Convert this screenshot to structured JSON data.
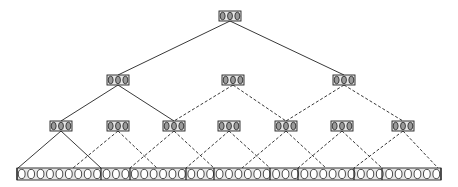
{
  "diagram": {
    "type": "tree",
    "colors": {
      "background": "#ffffff",
      "stroke": "#222222",
      "node_fill": "#e6e6e6",
      "ellipse_fill": "#9a9a9a"
    },
    "levels": [
      {
        "level": 0,
        "y": 11,
        "nodes": [
          {
            "id": "root",
            "cx": 230,
            "slots": 3
          }
        ]
      },
      {
        "level": 1,
        "y": 75,
        "nodes": [
          {
            "id": "l1-a",
            "cx": 118,
            "slots": 3
          },
          {
            "id": "l1-b",
            "cx": 233,
            "slots": 3
          },
          {
            "id": "l1-c",
            "cx": 344,
            "slots": 3
          }
        ]
      },
      {
        "level": 2,
        "y": 121,
        "nodes": [
          {
            "id": "l2-a",
            "cx": 61,
            "slots": 3
          },
          {
            "id": "l2-b",
            "cx": 118,
            "slots": 3
          },
          {
            "id": "l2-c",
            "cx": 174,
            "slots": 3
          },
          {
            "id": "l2-d",
            "cx": 229,
            "slots": 3
          },
          {
            "id": "l2-e",
            "cx": 286,
            "slots": 3
          },
          {
            "id": "l2-f",
            "cx": 342,
            "slots": 3
          },
          {
            "id": "l2-g",
            "cx": 403,
            "slots": 3
          }
        ]
      },
      {
        "level": 3,
        "y": 168,
        "strip": {
          "x1": 17,
          "x2": 441,
          "slots": 45
        }
      }
    ],
    "edges": [
      {
        "from": [
          230,
          21
        ],
        "to": [
          118,
          75
        ],
        "style": "solid"
      },
      {
        "from": [
          230,
          21
        ],
        "to": [
          344,
          75
        ],
        "style": "solid"
      },
      {
        "from": [
          118,
          85
        ],
        "to": [
          61,
          121
        ],
        "style": "solid"
      },
      {
        "from": [
          118,
          85
        ],
        "to": [
          174,
          121
        ],
        "style": "solid"
      },
      {
        "from": [
          233,
          85
        ],
        "to": [
          174,
          121
        ],
        "style": "dashed"
      },
      {
        "from": [
          233,
          85
        ],
        "to": [
          286,
          121
        ],
        "style": "dashed"
      },
      {
        "from": [
          344,
          85
        ],
        "to": [
          286,
          121
        ],
        "style": "dashed"
      },
      {
        "from": [
          344,
          85
        ],
        "to": [
          403,
          121
        ],
        "style": "dashed"
      },
      {
        "from": [
          61,
          131
        ],
        "to": [
          18,
          168
        ],
        "style": "solid"
      },
      {
        "from": [
          61,
          131
        ],
        "to": [
          101,
          168
        ],
        "style": "solid"
      },
      {
        "from": [
          118,
          131
        ],
        "to": [
          73,
          168
        ],
        "style": "dashed"
      },
      {
        "from": [
          118,
          131
        ],
        "to": [
          157,
          168
        ],
        "style": "dashed"
      },
      {
        "from": [
          174,
          131
        ],
        "to": [
          130,
          168
        ],
        "style": "dashed"
      },
      {
        "from": [
          174,
          131
        ],
        "to": [
          214,
          168
        ],
        "style": "dashed"
      },
      {
        "from": [
          229,
          131
        ],
        "to": [
          186,
          168
        ],
        "style": "dashed"
      },
      {
        "from": [
          229,
          131
        ],
        "to": [
          270,
          168
        ],
        "style": "dashed"
      },
      {
        "from": [
          286,
          131
        ],
        "to": [
          242,
          168
        ],
        "style": "dashed"
      },
      {
        "from": [
          286,
          131
        ],
        "to": [
          326,
          168
        ],
        "style": "dashed"
      },
      {
        "from": [
          342,
          131
        ],
        "to": [
          298,
          168
        ],
        "style": "dashed"
      },
      {
        "from": [
          342,
          131
        ],
        "to": [
          382,
          168
        ],
        "style": "dashed"
      },
      {
        "from": [
          403,
          131
        ],
        "to": [
          354,
          168
        ],
        "style": "dashed"
      },
      {
        "from": [
          403,
          131
        ],
        "to": [
          438,
          168
        ],
        "style": "dashed"
      }
    ],
    "strip_dividers_x": [
      17,
      101,
      130,
      186,
      214,
      270,
      298,
      354,
      382,
      441
    ]
  }
}
